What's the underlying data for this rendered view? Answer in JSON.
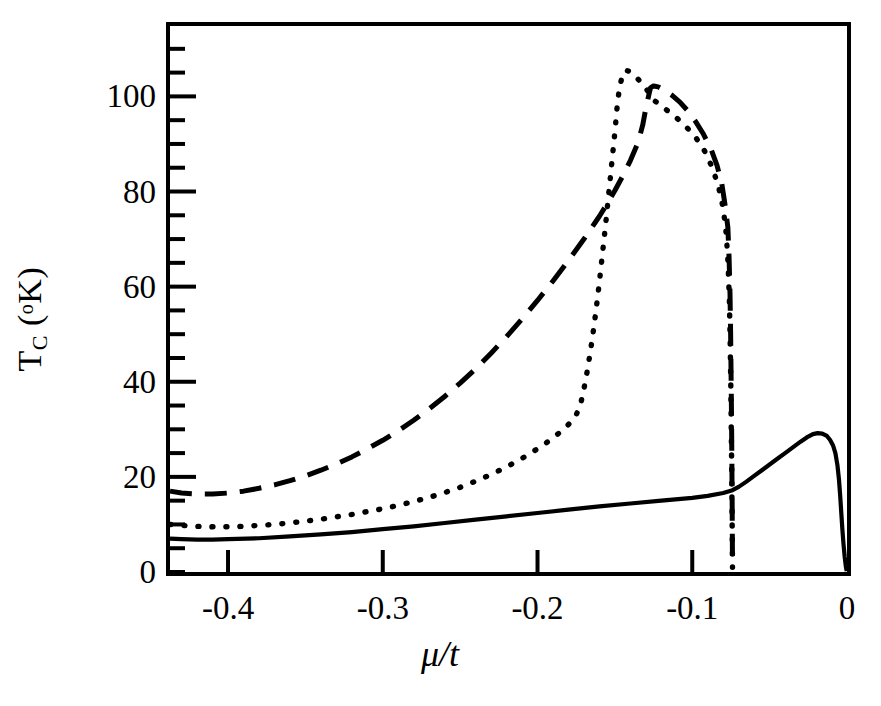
{
  "figure": {
    "ylabel_main": "T",
    "ylabel_sub": "C",
    "ylabel_unit_open": " (",
    "ylabel_deg": "o",
    "ylabel_k": "K)",
    "xlabel": "μ/t"
  },
  "chart_data": {
    "type": "line",
    "title": "",
    "xlabel": "μ/t",
    "ylabel": "T_C (°K)",
    "xlim": [
      -0.4375,
      0.0
    ],
    "ylim": [
      0,
      114.8
    ],
    "grid": false,
    "legend": "none",
    "xticks": [
      -0.4,
      -0.3,
      -0.2,
      -0.1,
      0
    ],
    "xticklabels": [
      "-0.4",
      "-0.3",
      "-0.2",
      "-0.1",
      "0"
    ],
    "yticks": [
      0,
      20,
      40,
      60,
      80,
      100
    ],
    "yticklabels": [
      "0",
      "20",
      "40",
      "60",
      "80",
      "100"
    ],
    "yminorticks": [
      5,
      10,
      15,
      25,
      30,
      35,
      45,
      50,
      55,
      65,
      70,
      75,
      85,
      90,
      95,
      105,
      110
    ],
    "series": [
      {
        "name": "dashed-curve",
        "style": "dashed",
        "color": "#000000",
        "points": [
          [
            -0.4375,
            17.0
          ],
          [
            -0.43,
            16.6
          ],
          [
            -0.42,
            16.4
          ],
          [
            -0.41,
            16.4
          ],
          [
            -0.4,
            16.6
          ],
          [
            -0.39,
            17.0
          ],
          [
            -0.38,
            17.6
          ],
          [
            -0.37,
            18.3
          ],
          [
            -0.36,
            19.2
          ],
          [
            -0.35,
            20.2
          ],
          [
            -0.34,
            21.4
          ],
          [
            -0.33,
            22.7
          ],
          [
            -0.32,
            24.2
          ],
          [
            -0.31,
            25.9
          ],
          [
            -0.3,
            27.7
          ],
          [
            -0.29,
            29.7
          ],
          [
            -0.28,
            31.9
          ],
          [
            -0.27,
            34.3
          ],
          [
            -0.26,
            36.9
          ],
          [
            -0.25,
            39.7
          ],
          [
            -0.24,
            42.7
          ],
          [
            -0.23,
            46.0
          ],
          [
            -0.22,
            49.5
          ],
          [
            -0.21,
            53.2
          ],
          [
            -0.2,
            57.1
          ],
          [
            -0.19,
            61.2
          ],
          [
            -0.18,
            65.5
          ],
          [
            -0.17,
            70.0
          ],
          [
            -0.16,
            74.8
          ],
          [
            -0.155,
            77.4
          ],
          [
            -0.15,
            80.2
          ],
          [
            -0.145,
            83.2
          ],
          [
            -0.14,
            86.5
          ],
          [
            -0.135,
            90.3
          ],
          [
            -0.132,
            94.0
          ],
          [
            -0.13,
            97.5
          ],
          [
            -0.128,
            100.4
          ],
          [
            -0.127,
            101.8
          ],
          [
            -0.125,
            102.2
          ],
          [
            -0.122,
            102.0
          ],
          [
            -0.118,
            101.3
          ],
          [
            -0.113,
            100.2
          ],
          [
            -0.108,
            98.8
          ],
          [
            -0.103,
            97.0
          ],
          [
            -0.098,
            94.8
          ],
          [
            -0.093,
            92.2
          ],
          [
            -0.088,
            89.0
          ],
          [
            -0.084,
            85.5
          ],
          [
            -0.081,
            81.8
          ],
          [
            -0.079,
            77.6
          ],
          [
            -0.077,
            72.5
          ],
          [
            -0.0762,
            66.0
          ],
          [
            -0.0756,
            58.5
          ],
          [
            -0.0752,
            50.0
          ],
          [
            -0.0749,
            41.0
          ],
          [
            -0.0746,
            32.0
          ],
          [
            -0.0744,
            23.0
          ],
          [
            -0.0742,
            14.0
          ],
          [
            -0.0741,
            7.0
          ],
          [
            -0.074,
            1.5
          ]
        ]
      },
      {
        "name": "dotted-curve",
        "style": "dotted",
        "color": "#000000",
        "points": [
          [
            -0.4375,
            10.0
          ],
          [
            -0.43,
            9.8
          ],
          [
            -0.42,
            9.6
          ],
          [
            -0.41,
            9.5
          ],
          [
            -0.4,
            9.5
          ],
          [
            -0.39,
            9.6
          ],
          [
            -0.38,
            9.8
          ],
          [
            -0.37,
            10.0
          ],
          [
            -0.36,
            10.3
          ],
          [
            -0.35,
            10.7
          ],
          [
            -0.34,
            11.1
          ],
          [
            -0.33,
            11.6
          ],
          [
            -0.32,
            12.1
          ],
          [
            -0.31,
            12.7
          ],
          [
            -0.3,
            13.3
          ],
          [
            -0.29,
            14.0
          ],
          [
            -0.28,
            14.8
          ],
          [
            -0.27,
            15.7
          ],
          [
            -0.26,
            16.7
          ],
          [
            -0.25,
            17.8
          ],
          [
            -0.24,
            19.1
          ],
          [
            -0.23,
            20.5
          ],
          [
            -0.22,
            22.1
          ],
          [
            -0.21,
            23.9
          ],
          [
            -0.2,
            25.9
          ],
          [
            -0.195,
            27.0
          ],
          [
            -0.19,
            28.2
          ],
          [
            -0.185,
            29.5
          ],
          [
            -0.18,
            31.0
          ],
          [
            -0.175,
            33.0
          ],
          [
            -0.172,
            35.5
          ],
          [
            -0.17,
            38.5
          ],
          [
            -0.168,
            42.0
          ],
          [
            -0.166,
            46.0
          ],
          [
            -0.164,
            50.5
          ],
          [
            -0.162,
            55.5
          ],
          [
            -0.16,
            61.0
          ],
          [
            -0.158,
            67.0
          ],
          [
            -0.156,
            73.0
          ],
          [
            -0.154,
            79.5
          ],
          [
            -0.152,
            86.0
          ],
          [
            -0.15,
            92.5
          ],
          [
            -0.1485,
            98.0
          ],
          [
            -0.147,
            102.0
          ],
          [
            -0.145,
            104.5
          ],
          [
            -0.143,
            105.5
          ],
          [
            -0.14,
            105.2
          ],
          [
            -0.136,
            104.0
          ],
          [
            -0.132,
            102.5
          ],
          [
            -0.128,
            100.8
          ],
          [
            -0.124,
            99.0
          ],
          [
            -0.118,
            97.5
          ],
          [
            -0.112,
            96.0
          ],
          [
            -0.105,
            94.0
          ],
          [
            -0.098,
            91.5
          ],
          [
            -0.092,
            88.5
          ],
          [
            -0.087,
            85.0
          ],
          [
            -0.083,
            81.0
          ],
          [
            -0.08,
            76.5
          ],
          [
            -0.078,
            71.0
          ],
          [
            -0.0768,
            64.5
          ],
          [
            -0.076,
            57.0
          ],
          [
            -0.0755,
            48.5
          ],
          [
            -0.0751,
            39.5
          ],
          [
            -0.0748,
            30.5
          ],
          [
            -0.0745,
            21.5
          ],
          [
            -0.0743,
            13.0
          ],
          [
            -0.0741,
            6.0
          ],
          [
            -0.074,
            1.0
          ]
        ]
      },
      {
        "name": "solid-curve",
        "style": "solid",
        "color": "#000000",
        "points": [
          [
            -0.4375,
            7.0
          ],
          [
            -0.43,
            6.9
          ],
          [
            -0.42,
            6.8
          ],
          [
            -0.41,
            6.8
          ],
          [
            -0.4,
            6.9
          ],
          [
            -0.38,
            7.1
          ],
          [
            -0.36,
            7.5
          ],
          [
            -0.34,
            7.9
          ],
          [
            -0.32,
            8.4
          ],
          [
            -0.3,
            9.0
          ],
          [
            -0.28,
            9.6
          ],
          [
            -0.26,
            10.3
          ],
          [
            -0.24,
            11.0
          ],
          [
            -0.22,
            11.7
          ],
          [
            -0.2,
            12.4
          ],
          [
            -0.18,
            13.1
          ],
          [
            -0.16,
            13.8
          ],
          [
            -0.14,
            14.4
          ],
          [
            -0.12,
            15.0
          ],
          [
            -0.1,
            15.6
          ],
          [
            -0.09,
            16.0
          ],
          [
            -0.08,
            16.6
          ],
          [
            -0.074,
            17.2
          ],
          [
            -0.07,
            17.9
          ],
          [
            -0.065,
            19.0
          ],
          [
            -0.06,
            20.2
          ],
          [
            -0.055,
            21.4
          ],
          [
            -0.05,
            22.6
          ],
          [
            -0.045,
            23.8
          ],
          [
            -0.04,
            25.0
          ],
          [
            -0.035,
            26.2
          ],
          [
            -0.03,
            27.4
          ],
          [
            -0.026,
            28.3
          ],
          [
            -0.022,
            29.0
          ],
          [
            -0.019,
            29.2
          ],
          [
            -0.016,
            29.1
          ],
          [
            -0.013,
            28.6
          ],
          [
            -0.011,
            27.8
          ],
          [
            -0.009,
            26.6
          ],
          [
            -0.0075,
            25.0
          ],
          [
            -0.0062,
            22.5
          ],
          [
            -0.0052,
            19.5
          ],
          [
            -0.0044,
            16.0
          ],
          [
            -0.0037,
            12.5
          ],
          [
            -0.003,
            9.0
          ],
          [
            -0.0023,
            6.0
          ],
          [
            -0.0015,
            3.2
          ],
          [
            -0.0008,
            1.3
          ],
          [
            -0.0002,
            0.2
          ]
        ]
      }
    ]
  }
}
